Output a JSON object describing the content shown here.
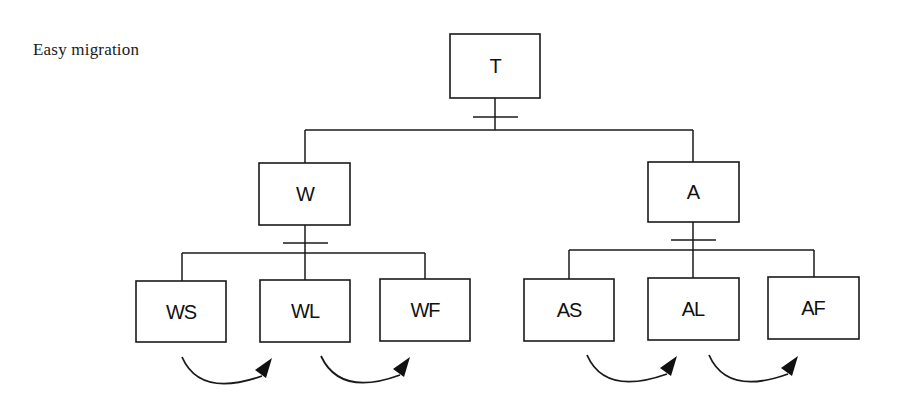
{
  "title": "Easy migration",
  "colors": {
    "stroke": "#1a1a1a",
    "text": "#111111",
    "background": "#ffffff"
  },
  "nodes": {
    "root": {
      "label": "T"
    },
    "left": {
      "label": "W"
    },
    "right": {
      "label": "A"
    },
    "left_children": [
      {
        "label": "WS"
      },
      {
        "label": "WL"
      },
      {
        "label": "WF"
      }
    ],
    "right_children": [
      {
        "label": "AS"
      },
      {
        "label": "AL"
      },
      {
        "label": "AF"
      }
    ]
  },
  "edges": [
    {
      "from": "T",
      "to": "W",
      "marker": "bar"
    },
    {
      "from": "T",
      "to": "A",
      "marker": "bar"
    },
    {
      "from": "W",
      "to": "WS",
      "marker": "bar"
    },
    {
      "from": "W",
      "to": "WL",
      "marker": "bar"
    },
    {
      "from": "W",
      "to": "WF",
      "marker": "bar"
    },
    {
      "from": "A",
      "to": "AS",
      "marker": "bar"
    },
    {
      "from": "A",
      "to": "AL",
      "marker": "bar"
    },
    {
      "from": "A",
      "to": "AF",
      "marker": "bar"
    }
  ],
  "migrations": [
    {
      "from": "WS",
      "to": "WL"
    },
    {
      "from": "WL",
      "to": "WF"
    },
    {
      "from": "AS",
      "to": "AL"
    },
    {
      "from": "AL",
      "to": "AF"
    }
  ]
}
